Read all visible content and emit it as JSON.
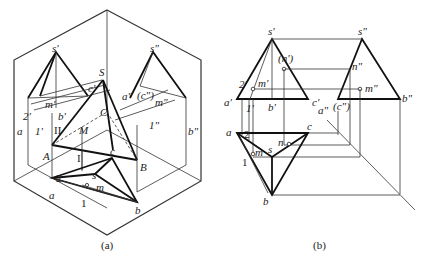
{
  "figure_a": {
    "caption": "(a)",
    "labels": {
      "s_prime": "s'",
      "s_dprime": "s\"",
      "S": "S",
      "c_prime": "c'",
      "a_dprime": "a\"",
      "c_dprime": "(c\")",
      "m_dprime": "m\"",
      "m_prime": "m'",
      "two_prime": "2'",
      "b_prime": "b'",
      "C": "C",
      "a_prime": "a",
      "one_prime": "1'",
      "II": "II",
      "M": "M",
      "one_dprime": "1\"",
      "b_dprime": "b\"",
      "A": "A",
      "I": "I",
      "B": "B",
      "c": "c",
      "two": "2",
      "s": "s",
      "m": "m",
      "a": "a",
      "one": "1",
      "b": "b"
    }
  },
  "figure_b": {
    "caption": "(b)",
    "labels": {
      "s_prime": "s'",
      "s_dprime": "s\"",
      "n_prime": "(n')",
      "n_dprime": "n\"",
      "two_prime": "2'",
      "m_prime": "m'",
      "m_dprime": "m\"",
      "a_prime": "a'",
      "one_prime": "1'",
      "b_prime": "b'",
      "c_prime": "c'",
      "a_dprime": "a\"",
      "c_dprime": "(c\")",
      "b_dprime": "b\"",
      "a": "a",
      "two": "2",
      "c": "c",
      "n": "n",
      "m": "m",
      "s": "s",
      "one": "1",
      "b": "b"
    }
  }
}
